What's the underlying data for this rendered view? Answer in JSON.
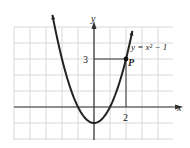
{
  "chart_data": {
    "type": "line",
    "title": "",
    "xlabel": "x",
    "ylabel": "y",
    "equation_label": "y = x² − 1",
    "point_label": "P",
    "point": {
      "x": 2,
      "y": 3
    },
    "tick_labels": {
      "x": [
        "2"
      ],
      "y": [
        "3"
      ]
    },
    "xlim": [
      -5,
      5
    ],
    "ylim": [
      -2,
      5
    ],
    "grid": true,
    "series": [
      {
        "name": "y = x^2 - 1",
        "function": "x^2 - 1",
        "x": [
          -2.6,
          -2,
          -1.5,
          -1,
          -0.5,
          0,
          0.5,
          1,
          1.5,
          2,
          2.4
        ],
        "y": [
          5.76,
          3,
          1.25,
          0,
          -0.75,
          -1,
          -0.75,
          0,
          1.25,
          3,
          4.76
        ]
      }
    ],
    "guide_lines": [
      {
        "from": [
          0,
          3
        ],
        "to": [
          2,
          3
        ]
      },
      {
        "from": [
          2,
          3
        ],
        "to": [
          2,
          0
        ]
      }
    ]
  },
  "colors": {
    "grid": "#d8d8d8",
    "axis": "#333333",
    "curve": "#222222"
  }
}
